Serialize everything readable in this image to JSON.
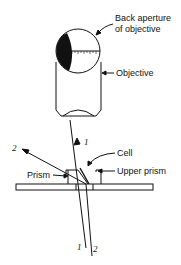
{
  "diagram": {
    "labels": {
      "back_aperture_line1": "Back aperture",
      "back_aperture_line2": "of objective",
      "objective": "Objective",
      "cell": "Cell",
      "prism": "Prism",
      "upper_prism": "Upper prism"
    },
    "rays": {
      "ray1_top": "1",
      "ray2_top": "2",
      "ray1_bottom": "1",
      "ray2_bottom": "2"
    },
    "colors": {
      "stroke": "#111111",
      "background": "#ffffff"
    }
  }
}
